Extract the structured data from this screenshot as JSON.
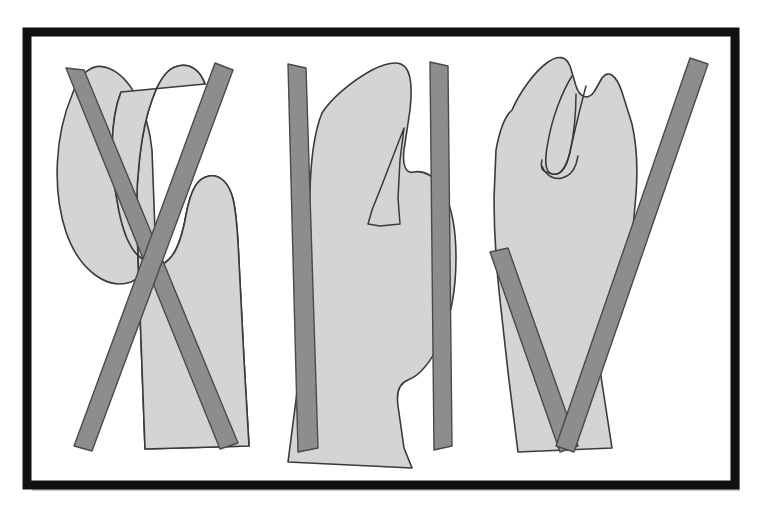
{
  "document": {
    "title": "Hand silhouette diagram with crossed bar overlays",
    "kind": "scanned line drawing",
    "panel_count": 3,
    "background_color": "#ffffff"
  },
  "frame": {
    "name": "outer-frame",
    "border_color": "#111111",
    "inner_fill": "#ffffff",
    "x": 27,
    "y": 32,
    "width": 708,
    "height": 453,
    "border_width": 9,
    "shadow_color": "#c8c8c8"
  },
  "style": {
    "shape_fill": "#d4d4d4",
    "shape_stroke": "#3a3a3a",
    "shape_stroke_width": 1.6,
    "bar_fill": "#8d8d8d",
    "bar_stroke": "#4a4a4a",
    "bar_stroke_width": 1.4,
    "detail_stroke": "#3a3a3a",
    "texture_opacity": 0.1
  },
  "panels": [
    {
      "id": "panel-1",
      "label": "Panel 1 — crossed bars over double-lobe hand shape",
      "bar_pattern": "X",
      "shapes": [
        {
          "name": "hand-silhouette-left-lobe",
          "path": "M 72 95 C 55 135 52 190 66 232 C 80 272 108 290 131 282 C 148 275 155 255 155 232 L 152 150 C 148 110 130 76 108 68 C 92 62 79 74 72 95 Z"
        },
        {
          "name": "hand-silhouette-main-body",
          "path": "M 121 92 C 110 120 110 165 117 200 C 122 232 130 250 141 258 C 150 265 158 268 166 262 C 176 255 182 238 186 215 C 191 188 198 178 209 176 C 220 174 229 183 233 199 C 237 215 238 240 239 262 L 244 360 L 249 446 L 145 449 L 141 340 L 137 230 C 135 180 141 130 152 100 C 159 80 168 68 178 66 C 190 63 200 70 205 84"
        },
        {
          "name": "hand-silhouette-outline-closed",
          "path": "M 121 92 C 110 120 110 165 117 200 C 122 232 130 250 141 258 C 150 265 158 268 166 262 C 176 255 182 238 186 215 C 191 188 198 178 209 176 C 220 174 229 183 233 199 C 237 215 238 240 239 262 L 244 360 L 249 446 L 145 449 L 141 340 L 137 230 C 135 180 141 130 152 100 C 159 80 168 68 178 66 C 190 63 200 70 205 84 Z"
        }
      ],
      "bars": [
        {
          "name": "bar-descending-right",
          "points": "66,68 84,70 238,443 220,449"
        },
        {
          "name": "bar-descending-left",
          "points": "215,63 233,70 92,451 74,446"
        }
      ],
      "details": []
    },
    {
      "id": "panel-2",
      "label": "Panel 2 — crossed bars over notched hand shape",
      "bar_pattern": "X",
      "shapes": [
        {
          "name": "hand-silhouette-body",
          "path": "M 322 113 C 330 100 350 82 372 70 C 388 62 400 60 406 68 C 412 76 412 92 410 110 L 404 150 C 402 166 406 174 414 172 C 424 170 436 176 444 192 C 452 208 456 232 456 258 C 456 290 450 320 440 342 C 430 364 418 376 408 380 C 400 383 396 392 398 406 L 404 448 L 412 468 L 288 462 L 296 400 L 304 330 L 308 260 L 310 190 C 311 156 315 130 322 113 Z"
        }
      ],
      "bars": [
        {
          "name": "bar-descending-right",
          "points": "288,64 306,68 318,448 298,452"
        },
        {
          "name": "bar-descending-left",
          "points": "430,62 448,66 452,446 434,450"
        }
      ],
      "details": [
        {
          "name": "thumb-notch-outline",
          "path": "M 404 128 L 380 190 L 372 210 L 368 224 L 380 226 L 400 224 L 398 198 L 400 160 Z"
        }
      ]
    },
    {
      "id": "panel-3",
      "label": "Panel 3 — V-shaped bar pair over hand shape with thumb outline",
      "bar_pattern": "V",
      "shapes": [
        {
          "name": "hand-silhouette-body",
          "path": "M 512 110 C 520 92 534 72 548 62 C 558 55 566 56 570 66 L 576 86 C 580 98 588 100 594 92 L 602 78 C 608 70 616 74 622 92 L 632 124 C 636 142 638 168 636 194 L 630 262 C 628 290 624 310 618 322 L 608 344 L 600 370 L 612 448 L 518 452 L 508 372 L 500 300 C 496 264 494 230 494 198 L 496 150 C 500 128 505 116 512 110 Z"
        }
      ],
      "bars": [
        {
          "name": "bar-v-left-stroke",
          "points": "490,252 508,248 578,446 560,452"
        },
        {
          "name": "bar-v-right-stroke",
          "points": "690,58 708,64 574,452 556,446"
        }
      ],
      "details": [
        {
          "name": "thumb-inner-outline",
          "path": "M 572 76 C 562 92 552 118 548 142 C 544 162 545 172 552 174 C 560 176 566 168 570 152 C 574 134 576 112 576 94"
        },
        {
          "name": "thumb-inner-outline-2",
          "path": "M 586 86 C 580 108 574 134 570 152 C 566 170 560 176 552 174 L 546 172 C 542 171 540 166 542 160"
        },
        {
          "name": "thumb-tip-curve",
          "path": "M 542 166 C 546 176 554 180 562 178 C 570 176 574 170 576 164 L 578 156"
        }
      ]
    }
  ]
}
